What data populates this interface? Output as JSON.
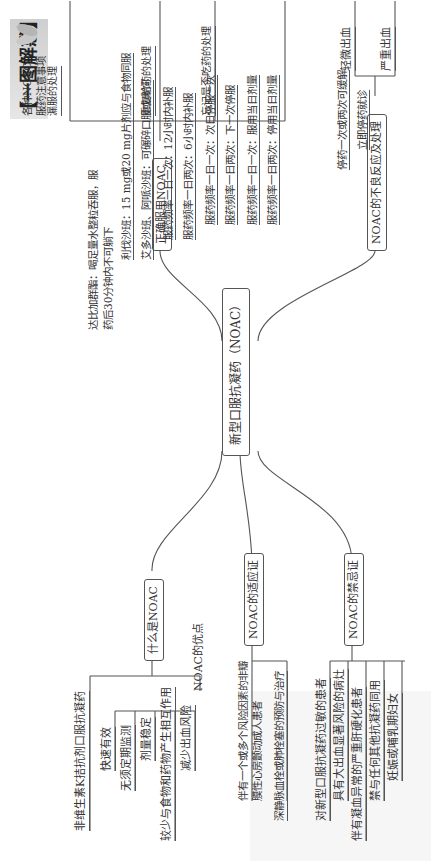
{
  "title": "【一图解惑】",
  "root": "新型口服抗凝药（NOAC）",
  "branches": {
    "what": {
      "label": "什么是NOAC",
      "definition": "非维生素K拮抗剂口服抗凝药",
      "advantages_label": "NOAC的优点",
      "advantages": [
        "快速有效",
        "无须定期监测",
        "剂量稳定",
        "较少与食物和药物产生相互作用",
        "减少出血风险"
      ]
    },
    "indications": {
      "label": "NOAC的适应证",
      "items": [
        "伴有一个或多个风险因素的非瓣膜性心房颤动成人患者",
        "深静脉血栓或肺栓塞的预防与治疗"
      ]
    },
    "contraindications": {
      "label": "NOAC的禁忌证",
      "items": [
        "对新型口服抗凝药过敏的患者",
        "具有大出血显著风险的病灶",
        "伴有凝血异常的严重肝硬化患者",
        "禁与任何其他抗凝药同用",
        "妊娠或哺乳期妇女"
      ]
    },
    "usage": {
      "label": "正确服用NOAC",
      "notes_label": "各种NOAC服药注意事项",
      "notes": [
        "达比加群酯：喝足量水整粒吞服，服药后30分钟内不可躺下",
        "利伐沙班：15 mg或20 mg片剂应与食物同服",
        "艾多沙班、阿哌沙班：可碾碎口服或鼻饲"
      ],
      "missed_label": "漏服的处理",
      "missed": [
        "服药频率一日一次：12小时内补服",
        "服药频率一日两次：6小时内补服"
      ],
      "double_label": "重复给药的处理",
      "double": [
        "服药频率一日一次：次日停服一次",
        "服药频率一日两次：下一次停服"
      ],
      "forgot_label": "忘记是否吃药的处理",
      "forgot": [
        "服药频率一日一次：服用当日剂量",
        "服药频率一日两次：停用当日剂量"
      ]
    },
    "adverse": {
      "label": "NOAC的不良反应及处理",
      "items": [
        {
          "type": "轻微出血",
          "action": "停药一次或两次可缓解"
        },
        {
          "type": "严重出血",
          "action": "立即停药就诊"
        }
      ]
    }
  }
}
